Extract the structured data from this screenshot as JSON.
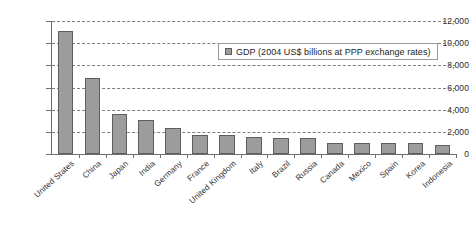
{
  "chart_data": {
    "type": "bar",
    "title": "",
    "subtitle": "",
    "xlabel": "",
    "ylabel": "",
    "ylim": [
      0,
      12000
    ],
    "ytick_labels": [
      "0",
      "2,000",
      "4,000",
      "6,000",
      "8,000",
      "10,000",
      "12,000"
    ],
    "ytick_values": [
      0,
      2000,
      4000,
      6000,
      8000,
      10000,
      12000
    ],
    "grid": true,
    "grid_style": "dashed-horizontal",
    "legend_position": "inside-top-right",
    "legend_entries": [
      "GDP (2004 US$ billions at PPP exchange rates)"
    ],
    "series_name": "GDP (2004 US$ billions at PPP exchange rates)",
    "bar_color": "#9c9c9c",
    "bar_edge_color": "#5e5e5e",
    "categories": [
      "United States",
      "China",
      "Japan",
      "India",
      "Germany",
      "France",
      "United Kingdom",
      "Italy",
      "Brazil",
      "Russia",
      "Canada",
      "Mexico",
      "Spain",
      "Korea",
      "Indonesia"
    ],
    "values": [
      11100,
      6900,
      3600,
      3100,
      2350,
      1750,
      1700,
      1550,
      1450,
      1400,
      1020,
      1010,
      1000,
      980,
      800
    ]
  },
  "legend": {
    "label": "GDP (2004 US$ billions at PPP exchange rates)",
    "swatch_color": "#9c9c9c"
  }
}
